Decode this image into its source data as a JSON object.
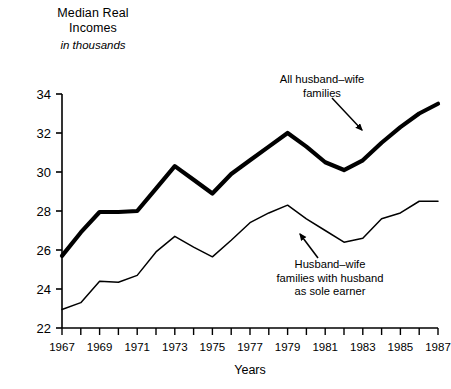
{
  "chart": {
    "title_lines": [
      "Median Real",
      "Incomes"
    ],
    "subtitle": "in thousands",
    "xlabel": "Years",
    "ink_color": "#000000",
    "background": "#ffffff"
  },
  "annotations": [
    {
      "id": "all-families",
      "lines": [
        "All husband–wife",
        "families"
      ],
      "target_year": 1983,
      "target_value": 31.4
    },
    {
      "id": "sole-earner",
      "lines": [
        "Husband–wife",
        "families with husband",
        "as sole earner"
      ],
      "target_year": 1983,
      "target_value": 26.5
    }
  ],
  "chart_data": {
    "type": "line",
    "title": "Median Real Incomes",
    "subtitle": "in thousands",
    "xlabel": "Years",
    "ylabel": "Median Real Incomes in thousands",
    "xlim": [
      1967,
      1987
    ],
    "ylim": [
      22,
      34
    ],
    "yticks": [
      22,
      24,
      26,
      28,
      30,
      32,
      34
    ],
    "xticks": [
      1967,
      1968,
      1969,
      1970,
      1971,
      1972,
      1973,
      1974,
      1975,
      1976,
      1977,
      1978,
      1979,
      1980,
      1981,
      1982,
      1983,
      1984,
      1985,
      1986,
      1987
    ],
    "xtick_labels_shown": [
      1967,
      1969,
      1971,
      1973,
      1975,
      1977,
      1979,
      1981,
      1983,
      1985,
      1987
    ],
    "grid": false,
    "legend": "annotations-with-arrows",
    "x": [
      1967,
      1968,
      1969,
      1970,
      1971,
      1972,
      1973,
      1974,
      1975,
      1976,
      1977,
      1978,
      1979,
      1980,
      1981,
      1982,
      1983,
      1984,
      1985,
      1986,
      1987
    ],
    "series": [
      {
        "name": "All husband–wife families",
        "style": "thick",
        "line_width": 4.2,
        "values": [
          25.7,
          26.9,
          27.95,
          27.95,
          28.0,
          29.15,
          30.3,
          29.6,
          28.9,
          29.9,
          30.6,
          31.3,
          32.0,
          31.3,
          30.5,
          30.1,
          30.6,
          31.5,
          32.3,
          33.0,
          33.5
        ]
      },
      {
        "name": "Husband–wife families with husband as sole earner",
        "style": "thin",
        "line_width": 1.5,
        "values": [
          22.95,
          23.3,
          24.4,
          24.35,
          24.7,
          25.9,
          26.7,
          26.15,
          25.65,
          26.5,
          27.4,
          27.9,
          28.3,
          27.6,
          27.0,
          26.4,
          26.6,
          27.6,
          27.9,
          28.5,
          28.5
        ]
      }
    ]
  }
}
